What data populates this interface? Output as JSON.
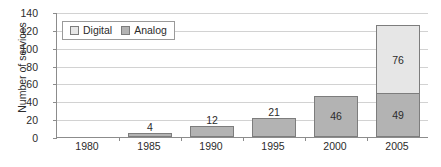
{
  "chart_data": {
    "type": "bar",
    "subtype": "stacked-column",
    "title": "",
    "xlabel": "",
    "ylabel": "Number of services",
    "categories": [
      "1980",
      "1985",
      "1990",
      "1995",
      "2000",
      "2005"
    ],
    "series": [
      {
        "name": "Analog",
        "color": "#b3b3b3",
        "values": [
          0,
          4,
          12,
          21,
          46,
          49
        ],
        "labels": [
          "",
          "4",
          "12",
          "21",
          "46",
          "49"
        ]
      },
      {
        "name": "Digital",
        "color": "#e6e6e6",
        "values": [
          0,
          0,
          0,
          0,
          0,
          76
        ],
        "labels": [
          "",
          "",
          "",
          "",
          "",
          "76"
        ]
      }
    ],
    "totals": [
      0,
      4,
      12,
      21,
      46,
      125
    ],
    "ylim": [
      0,
      140
    ],
    "yticks": [
      0,
      20,
      40,
      60,
      80,
      100,
      120,
      140
    ],
    "ytick_labels": [
      "0",
      "20",
      "40",
      "60",
      "80",
      "100",
      "120",
      "140"
    ],
    "grid": "horizontal",
    "legend_position": "top-left-inside",
    "legend_entries": [
      "Digital",
      "Analog"
    ]
  },
  "axes": {
    "y_title": "Number of services"
  },
  "legend": {
    "items": [
      {
        "label": "Digital",
        "swatch": "legend-swatch-digital-icon"
      },
      {
        "label": "Analog",
        "swatch": "legend-swatch-analog-icon"
      }
    ]
  }
}
